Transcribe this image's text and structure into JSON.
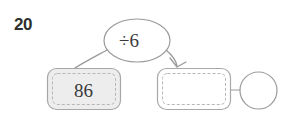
{
  "worksheet": {
    "question_number": "20",
    "diagram_type": "function-machine",
    "colors": {
      "stroke": "#9a9a9a",
      "dashed_stroke": "#b6b6b6",
      "box_fill": "#ededed",
      "empty_fill": "#ffffff",
      "text": "#3a3a3a",
      "number_text": "#2e2e2e"
    },
    "nodes": {
      "operation_bubble": {
        "label": "÷6",
        "shape": "ellipse",
        "filled": false
      },
      "input_box": {
        "label": "86",
        "shape": "rounded-rect",
        "filled": true
      },
      "output_box": {
        "label": "",
        "shape": "rounded-rect",
        "filled": false
      },
      "answer_circle": {
        "label": "",
        "shape": "circle",
        "filled": false
      }
    },
    "connectors": {
      "input_to_bubble": {
        "style": "curve",
        "arrowhead": false
      },
      "bubble_to_output": {
        "style": "curve",
        "arrowhead": true
      },
      "output_to_circle": {
        "style": "line",
        "arrowhead": false
      }
    }
  }
}
